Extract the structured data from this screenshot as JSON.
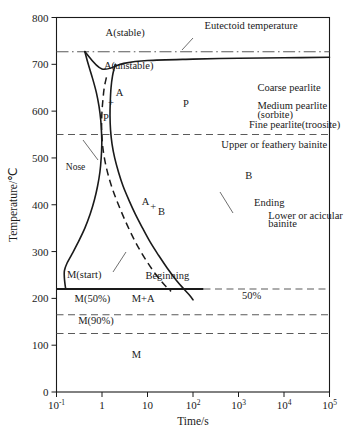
{
  "chart_data": {
    "type": "line",
    "title": "",
    "xlabel": "Time/s",
    "ylabel": "Temperature/℃",
    "xscale": "log",
    "xlim": [
      0.1,
      100000
    ],
    "ylim": [
      0,
      800
    ],
    "grid": false,
    "legend_position": "none",
    "x_ticks": [
      {
        "value": 0.1,
        "mantissa": "10",
        "exponent": "-1"
      },
      {
        "value": 1,
        "mantissa": "1",
        "exponent": ""
      },
      {
        "value": 10,
        "mantissa": "10",
        "exponent": ""
      },
      {
        "value": 100,
        "mantissa": "10",
        "exponent": "2"
      },
      {
        "value": 1000,
        "mantissa": "10",
        "exponent": "3"
      },
      {
        "value": 10000,
        "mantissa": "10",
        "exponent": "4"
      },
      {
        "value": 100000,
        "mantissa": "10",
        "exponent": "5"
      }
    ],
    "y_ticks": [
      0,
      100,
      200,
      300,
      400,
      500,
      600,
      700,
      800
    ],
    "series": [
      {
        "name": "transformation-begin",
        "style": "solid",
        "points": [
          [
            0.42,
            727
          ],
          [
            0.5,
            700
          ],
          [
            0.62,
            670
          ],
          [
            0.75,
            640
          ],
          [
            0.86,
            610
          ],
          [
            0.94,
            580
          ],
          [
            0.98,
            550
          ],
          [
            0.99,
            530
          ],
          [
            0.96,
            500
          ],
          [
            0.9,
            470
          ],
          [
            0.8,
            440
          ],
          [
            0.68,
            410
          ],
          [
            0.55,
            380
          ],
          [
            0.42,
            350
          ],
          [
            0.3,
            320
          ],
          [
            0.22,
            295
          ],
          [
            0.17,
            275
          ],
          [
            0.15,
            260
          ],
          [
            0.148,
            250
          ],
          [
            0.15,
            240
          ],
          [
            0.155,
            228
          ],
          [
            0.16,
            220
          ]
        ]
      },
      {
        "name": "fifty-percent-transformed",
        "style": "dashed",
        "points": [
          [
            1.25,
            672
          ],
          [
            1.12,
            650
          ],
          [
            1.05,
            625
          ],
          [
            1.0,
            600
          ],
          [
            0.98,
            575
          ],
          [
            0.99,
            550
          ],
          [
            1.05,
            520
          ],
          [
            1.18,
            490
          ],
          [
            1.4,
            460
          ],
          [
            1.75,
            430
          ],
          [
            2.3,
            400
          ],
          [
            3.1,
            370
          ],
          [
            4.3,
            340
          ],
          [
            6.2,
            310
          ],
          [
            9.5,
            280
          ],
          [
            15.0,
            252
          ],
          [
            24.0,
            228
          ],
          [
            33.0,
            215
          ]
        ]
      },
      {
        "name": "transformation-end",
        "style": "solid",
        "points": [
          [
            1.95,
            700
          ],
          [
            1.7,
            675
          ],
          [
            1.58,
            650
          ],
          [
            1.52,
            620
          ],
          [
            1.5,
            590
          ],
          [
            1.54,
            560
          ],
          [
            1.66,
            530
          ],
          [
            1.9,
            500
          ],
          [
            2.3,
            470
          ],
          [
            2.9,
            440
          ],
          [
            3.9,
            410
          ],
          [
            5.4,
            380
          ],
          [
            7.8,
            350
          ],
          [
            11.5,
            320
          ],
          [
            17.5,
            292
          ],
          [
            27.0,
            265
          ],
          [
            42.0,
            240
          ],
          [
            63.0,
            220
          ],
          [
            85.0,
            206
          ],
          [
            100.0,
            197
          ]
        ]
      },
      {
        "name": "coarse-pearlite-upper-boundary",
        "style": "solid",
        "note": "upper solid curve asymptoting to eutectoid on right",
        "points": [
          [
            0.42,
            727
          ],
          [
            1.0,
            690
          ],
          [
            3.0,
            702
          ],
          [
            10,
            708
          ],
          [
            100,
            711
          ],
          [
            1000,
            713
          ],
          [
            10000,
            714
          ],
          [
            100000,
            715
          ]
        ]
      }
    ],
    "horizontal_lines": [
      {
        "name": "eutectoid-temperature",
        "value": 727,
        "style": "dash-dot"
      },
      {
        "name": "fine-pearlite-boundary",
        "value": 550,
        "style": "dashed"
      },
      {
        "name": "m-start",
        "value": 220,
        "style": "solid-then-dashed",
        "solid_until_x": 170
      },
      {
        "name": "m-fifty",
        "value": 165,
        "style": "dashed"
      },
      {
        "name": "m-ninety",
        "value": 125,
        "style": "dashed"
      }
    ],
    "annotations": [
      {
        "name": "a-stable",
        "text": "A(stable)",
        "x": 1.2,
        "y": 760
      },
      {
        "name": "eutectoid-temperature",
        "text": "Eutectoid temperature",
        "x": 180,
        "y": 775
      },
      {
        "name": "a-unstable",
        "text": "A(unstable)",
        "x": 1.1,
        "y": 690
      },
      {
        "name": "coarse-pearlite",
        "text": "Coarse pearlite",
        "x": 2600,
        "y": 643
      },
      {
        "name": "p-region",
        "text": "P",
        "x": 60,
        "y": 608
      },
      {
        "name": "medium-pearlite",
        "text": "Medium pearlite",
        "x": 2600,
        "y": 605
      },
      {
        "name": "sorbite",
        "text": "(sorbite)",
        "x": 2600,
        "y": 586
      },
      {
        "name": "fine-pearlite",
        "text": "Fine pearlite(troosite)",
        "x": 1700,
        "y": 563
      },
      {
        "name": "upper-bainite",
        "text": "Upper or feathery bainite",
        "x": 420,
        "y": 521
      },
      {
        "name": "nose",
        "text": "Nose",
        "x": 0.16,
        "y": 474
      },
      {
        "name": "b-region",
        "text": "B",
        "x": 1400,
        "y": 455
      },
      {
        "name": "ending",
        "text": "Ending",
        "x": 2200,
        "y": 398
      },
      {
        "name": "lower-bainite-line1",
        "text": "Lower or acicular",
        "x": 4500,
        "y": 370
      },
      {
        "name": "lower-bainite-line2",
        "text": "bainite",
        "x": 4500,
        "y": 352
      },
      {
        "name": "beginning",
        "text": "Beginning",
        "x": 9,
        "y": 242
      },
      {
        "name": "m-start-label",
        "text": "M(start)",
        "x": 0.17,
        "y": 243
      },
      {
        "name": "fifty-percent",
        "text": "50%",
        "x": 1200,
        "y": 198
      },
      {
        "name": "m-fifty-label",
        "text": "M(50%)",
        "x": 0.25,
        "y": 193
      },
      {
        "name": "m-plus-a",
        "text": "M+A",
        "x": 4.5,
        "y": 193
      },
      {
        "name": "m-ninety-label",
        "text": "M(90%)",
        "x": 0.3,
        "y": 145
      },
      {
        "name": "m-region",
        "text": "M",
        "x": 4.5,
        "y": 72
      },
      {
        "name": "a-plus-p-a",
        "text": "A",
        "x": 2.0,
        "y": 632
      },
      {
        "name": "a-plus-p-plus",
        "text": "+",
        "x": 1.35,
        "y": 612
      },
      {
        "name": "a-plus-p-p",
        "text": "P",
        "x": 1.05,
        "y": 578
      },
      {
        "name": "a-plus-b-a",
        "text": "A",
        "x": 7.5,
        "y": 400
      },
      {
        "name": "a-plus-b-plus",
        "text": "+",
        "x": 11.5,
        "y": 388
      },
      {
        "name": "a-plus-b-b",
        "text": "B",
        "x": 17,
        "y": 378
      }
    ]
  },
  "colors": {
    "ink": "#1a1a1a",
    "guide": "#5a5a5a",
    "background": "#ffffff"
  }
}
